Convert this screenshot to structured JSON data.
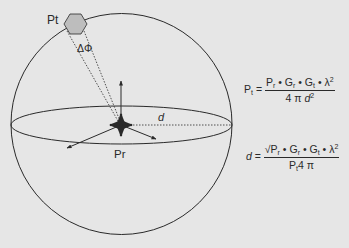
{
  "diagram": {
    "labels": {
      "transmitter": "Pt",
      "receiver": "Pr",
      "angle": "ΔΦ",
      "distance": "d"
    },
    "colors": {
      "background": "#e6e6e6",
      "stroke": "#2a2a2a",
      "hexagon_fill": "#bdbdbd"
    }
  },
  "formulas": {
    "pt": {
      "lhs": "P",
      "lhs_sub": "t",
      "eq": " = ",
      "numerator": {
        "t1": "P",
        "t1_sub": "r",
        "dot1": " • ",
        "t2": "G",
        "t2_sub": "r",
        "dot2": " • ",
        "t3": "G",
        "t3_sub": "t",
        "dot3": " • ",
        "t4": "λ",
        "t4_sup": "2"
      },
      "denominator": {
        "coef": "4 π ",
        "var": "d",
        "var_sup": "2"
      }
    },
    "d": {
      "lhs": "d",
      "eq": " = ",
      "sqrt": "√",
      "numerator": {
        "t1": "P",
        "t1_sub": "r",
        "dot1": " • ",
        "t2": "G",
        "t2_sub": "r",
        "dot2": " • ",
        "t3": "G",
        "t3_sub": "t",
        "dot3": " • ",
        "t4": "λ",
        "t4_sup": "2"
      },
      "denominator": {
        "t1": "P",
        "t1_sub": "t",
        "rest": "4 π"
      }
    }
  }
}
